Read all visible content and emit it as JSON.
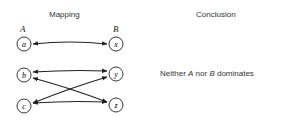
{
  "headers": {
    "mapping": "Mapping",
    "conclusion": "Conclusion"
  },
  "set_labels": {
    "left": "A",
    "right": "B"
  },
  "left_nodes": [
    {
      "id": "a",
      "label": "a",
      "cx": 24,
      "cy": 44
    },
    {
      "id": "b",
      "label": "b",
      "cx": 24,
      "cy": 75
    },
    {
      "id": "c",
      "label": "c",
      "cx": 24,
      "cy": 106
    }
  ],
  "right_nodes": [
    {
      "id": "x",
      "label": "x",
      "cx": 116,
      "cy": 44
    },
    {
      "id": "y",
      "label": "y",
      "cx": 116,
      "cy": 74
    },
    {
      "id": "z",
      "label": "z",
      "cx": 116,
      "cy": 105
    }
  ],
  "mappings": [
    {
      "from": "a",
      "to": "x",
      "bidirectional": true
    },
    {
      "from": "b",
      "to": "y",
      "bidirectional": true
    },
    {
      "from": "b",
      "to": "z",
      "bidirectional": true
    },
    {
      "from": "c",
      "to": "y",
      "bidirectional": true
    },
    {
      "from": "c",
      "to": "z",
      "bidirectional": true
    }
  ],
  "conclusion": {
    "prefix": "Neither ",
    "a": "A",
    "middle": " nor ",
    "b": "B",
    "suffix": " dominates"
  }
}
